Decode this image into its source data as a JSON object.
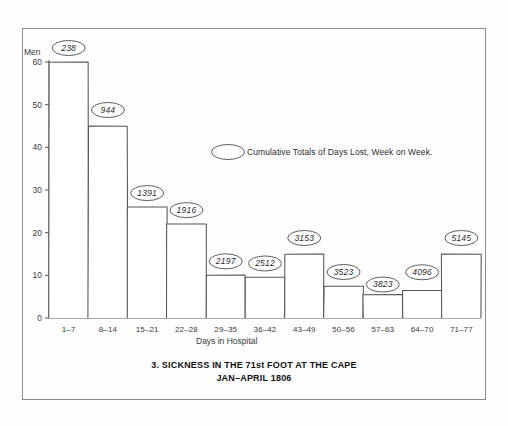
{
  "chart_data": {
    "type": "bar",
    "title": "3. SICKNESS IN THE 71st FOOT AT THE CAPE",
    "subtitle": "JAN–APRIL 1806",
    "xlabel": "Days in Hospital",
    "ylabel": "Men",
    "ylim": [
      0,
      60
    ],
    "yticks": [
      0,
      10,
      20,
      30,
      40,
      50,
      60
    ],
    "grid": false,
    "legend_position": "inside-upper-right",
    "legend_text": "Cumulative Totals of Days Lost, Week on Week.",
    "categories": [
      "1–7",
      "8–14",
      "15–21",
      "22–28",
      "29–35",
      "36–42",
      "43–49",
      "50–56",
      "57–63",
      "64–70",
      "71–77"
    ],
    "values": [
      60,
      45,
      26,
      22,
      10,
      9.5,
      15,
      7.5,
      5.5,
      6.5,
      15
    ],
    "annotations": [
      "238",
      "944",
      "1391",
      "1916",
      "2197",
      "2512",
      "3153",
      "3523",
      "3823",
      "4096",
      "5145"
    ],
    "annotation_label": "Cumulative totals of days lost"
  },
  "colors": {
    "bar_stroke": "#555555",
    "bar_fill": "#ffffff",
    "frame": "#8c8c8c",
    "text": "#2b2b2b"
  }
}
